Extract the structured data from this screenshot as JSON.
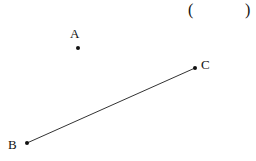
{
  "answer_bracket": {
    "open": "(",
    "close": ")"
  },
  "points": {
    "A": {
      "label": "A",
      "x": 78,
      "y": 48
    },
    "B": {
      "label": "B",
      "x": 27,
      "y": 143
    },
    "C": {
      "label": "C",
      "x": 195,
      "y": 68
    }
  },
  "segments": [
    {
      "from": "B",
      "to": "C"
    }
  ],
  "colors": {
    "ink": "#111111",
    "line": "#333333"
  }
}
